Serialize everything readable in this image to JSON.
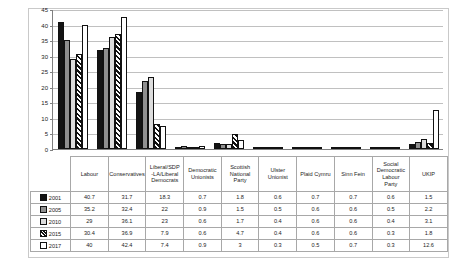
{
  "chart_data": {
    "type": "bar",
    "title": "",
    "xlabel": "",
    "ylabel": "",
    "ylim": [
      0,
      45
    ],
    "ytick_step": 5,
    "yticks": [
      0,
      5,
      10,
      15,
      20,
      25,
      30,
      35,
      40,
      45
    ],
    "grid": true,
    "legend_position": "table-row-headers",
    "categories": [
      "Labour",
      "Conservatives",
      "Liberal/SDP-LA/Liberal Democrats",
      "Democratic Unionists",
      "Scottish National Party",
      "Ulster Unionist",
      "Plaid Cymru",
      "Sinn Fein",
      "Social Democratic Labour Party",
      "UKIP"
    ],
    "series": [
      {
        "name": "2001",
        "swatch": "s0",
        "values": [
          40.7,
          31.7,
          18.3,
          0.7,
          1.8,
          0.6,
          0.7,
          0.7,
          0.6,
          1.5
        ]
      },
      {
        "name": "2005",
        "swatch": "s1",
        "values": [
          35.2,
          32.4,
          22.0,
          0.9,
          1.5,
          0.5,
          0.6,
          0.6,
          0.5,
          2.2
        ]
      },
      {
        "name": "2010",
        "swatch": "s2",
        "values": [
          29.0,
          36.1,
          23.0,
          0.6,
          1.7,
          0.4,
          0.6,
          0.6,
          0.4,
          3.1
        ]
      },
      {
        "name": "2015",
        "swatch": "s3",
        "values": [
          30.4,
          36.9,
          7.9,
          0.6,
          4.7,
          0.4,
          0.6,
          0.6,
          0.3,
          1.8
        ]
      },
      {
        "name": "2017",
        "swatch": "s4",
        "values": [
          40.0,
          42.4,
          7.4,
          0.9,
          3.0,
          0.3,
          0.5,
          0.7,
          0.3,
          12.6
        ]
      }
    ],
    "value_labels": [
      [
        "40.7",
        "31.7",
        "18.3",
        "0.7",
        "1.8",
        "0.6",
        "0.7",
        "0.7",
        "0.6",
        "1.5"
      ],
      [
        "35.2",
        "32.4",
        "22",
        "0.9",
        "1.5",
        "0.5",
        "0.6",
        "0.6",
        "0.5",
        "2.2"
      ],
      [
        "29",
        "36.1",
        "23",
        "0.6",
        "1.7",
        "0.4",
        "0.6",
        "0.6",
        "0.4",
        "3.1"
      ],
      [
        "30.4",
        "36.9",
        "7.9",
        "0.6",
        "4.7",
        "0.4",
        "0.6",
        "0.6",
        "0.3",
        "1.8"
      ],
      [
        "40",
        "42.4",
        "7.4",
        "0.9",
        "3",
        "0.3",
        "0.5",
        "0.7",
        "0.3",
        "12.6"
      ]
    ],
    "category_label_lines": [
      [
        "Labour"
      ],
      [
        "Conservatives"
      ],
      [
        "Liberal/SDP",
        "-LA/Liberal",
        "Democrats"
      ],
      [
        "Democratic",
        "Unionists"
      ],
      [
        "Scottish",
        "National",
        "Party"
      ],
      [
        "Ulster",
        "Unionist"
      ],
      [
        "Plaid Cymru"
      ],
      [
        "Sinn Fein"
      ],
      [
        "Social",
        "Democratic",
        "Labour",
        "Party"
      ],
      [
        "UKIP"
      ]
    ]
  },
  "colors": {
    "series_2001": "#141414",
    "series_2005": "#8f8f8f",
    "series_2010": "#dcdcdc",
    "series_2015": "#111111",
    "series_2017": "#ffffff",
    "gridline": "#c0c0c0",
    "axis": "#808080",
    "table_border": "#a8a8a8",
    "frame": "#c9c9c9",
    "background": "#ffffff"
  }
}
